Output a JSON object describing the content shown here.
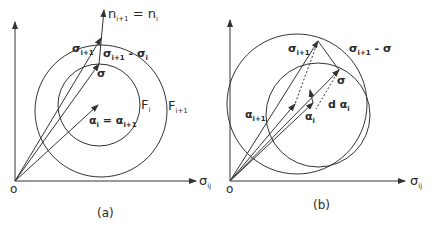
{
  "figure": {
    "panel_a": {
      "caption": "(a)",
      "origin_label": "o",
      "x_axis_label": "σ",
      "x_axis_sub": "ij",
      "normal_label": "n",
      "normal_label_sub": "i+1",
      "normal_eq": " = n",
      "normal_eq_sub": "i",
      "sigma_next_label": "σ",
      "sigma_next_sub": "i+1",
      "delta_label": "σ",
      "delta_label_sub": "i+1",
      "delta_minus": " - σ",
      "delta_minus_sub": "i",
      "sigma_label": "σ",
      "alpha_label": "α",
      "alpha_sub": "i",
      "alpha_eq": " = α",
      "alpha_eq_sub": "i+1",
      "inner_surface_label": "F",
      "inner_surface_sub": "i",
      "outer_surface_label": "F",
      "outer_surface_sub": "i+1"
    },
    "panel_b": {
      "caption": "(b)",
      "origin_label": "o",
      "x_axis_label": "σ",
      "x_axis_sub": "ij",
      "sigma_next_label": "σ",
      "sigma_next_sub": "i+1",
      "delta_label": "σ",
      "delta_label_sub": "i+1",
      "delta_minus": " - σ",
      "sigma_label": "σ",
      "alpha_next_label": "α",
      "alpha_next_sub": "i+1",
      "alpha_label": "α",
      "alpha_sub": "i",
      "dalpha_label": "d α",
      "dalpha_sub": "i"
    }
  }
}
